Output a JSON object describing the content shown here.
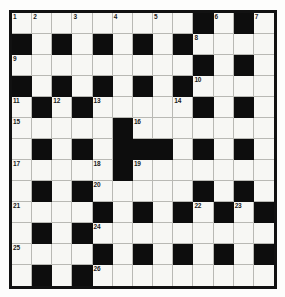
{
  "puzzle": {
    "title": "Crossword Grid",
    "type": "crossword",
    "size": {
      "rows": 13,
      "cols": 13
    },
    "colors": {
      "block": "#0d0d0d",
      "open": "#f7f7f4",
      "frame": "#111111",
      "gridline": "#b9b9b4",
      "number_text": "#1a1a1a",
      "page_background": "#fdfdfc"
    },
    "legend": {
      "white_symbol": ".",
      "black_symbol": "#"
    },
    "clue_number_count": 26,
    "clue_numbers": [
      1,
      2,
      3,
      4,
      5,
      6,
      7,
      8,
      9,
      10,
      11,
      12,
      13,
      14,
      15,
      16,
      17,
      18,
      19,
      20,
      21,
      22,
      23,
      24,
      25,
      26
    ],
    "rows": [
      {
        "index": 1,
        "pattern": ".........#.#.",
        "cells": [
          {
            "state": "white",
            "number": "1"
          },
          {
            "state": "white",
            "number": "2"
          },
          {
            "state": "white",
            "number": ""
          },
          {
            "state": "white",
            "number": "3"
          },
          {
            "state": "white",
            "number": ""
          },
          {
            "state": "white",
            "number": "4"
          },
          {
            "state": "white",
            "number": ""
          },
          {
            "state": "white",
            "number": "5"
          },
          {
            "state": "white",
            "number": ""
          },
          {
            "state": "black",
            "number": ""
          },
          {
            "state": "white",
            "number": "6"
          },
          {
            "state": "black",
            "number": ""
          },
          {
            "state": "white",
            "number": "7"
          }
        ]
      },
      {
        "index": 2,
        "pattern": "#.#.#.#.#....",
        "cells": [
          {
            "state": "black",
            "number": ""
          },
          {
            "state": "white",
            "number": ""
          },
          {
            "state": "black",
            "number": ""
          },
          {
            "state": "white",
            "number": ""
          },
          {
            "state": "black",
            "number": ""
          },
          {
            "state": "white",
            "number": ""
          },
          {
            "state": "black",
            "number": ""
          },
          {
            "state": "white",
            "number": ""
          },
          {
            "state": "black",
            "number": ""
          },
          {
            "state": "white",
            "number": "8"
          },
          {
            "state": "white",
            "number": ""
          },
          {
            "state": "white",
            "number": ""
          },
          {
            "state": "white",
            "number": ""
          }
        ]
      },
      {
        "index": 3,
        "pattern": ".........#.#.",
        "cells": [
          {
            "state": "white",
            "number": "9"
          },
          {
            "state": "white",
            "number": ""
          },
          {
            "state": "white",
            "number": ""
          },
          {
            "state": "white",
            "number": ""
          },
          {
            "state": "white",
            "number": ""
          },
          {
            "state": "white",
            "number": ""
          },
          {
            "state": "white",
            "number": ""
          },
          {
            "state": "white",
            "number": ""
          },
          {
            "state": "white",
            "number": ""
          },
          {
            "state": "black",
            "number": ""
          },
          {
            "state": "white",
            "number": ""
          },
          {
            "state": "black",
            "number": ""
          },
          {
            "state": "white",
            "number": ""
          }
        ]
      },
      {
        "index": 4,
        "pattern": "#.#.#.#.#....",
        "cells": [
          {
            "state": "black",
            "number": ""
          },
          {
            "state": "white",
            "number": ""
          },
          {
            "state": "black",
            "number": ""
          },
          {
            "state": "white",
            "number": ""
          },
          {
            "state": "black",
            "number": ""
          },
          {
            "state": "white",
            "number": ""
          },
          {
            "state": "black",
            "number": ""
          },
          {
            "state": "white",
            "number": ""
          },
          {
            "state": "black",
            "number": ""
          },
          {
            "state": "white",
            "number": "10"
          },
          {
            "state": "white",
            "number": ""
          },
          {
            "state": "white",
            "number": ""
          },
          {
            "state": "white",
            "number": ""
          }
        ]
      },
      {
        "index": 5,
        "pattern": ".#.#....#.#.#",
        "cells": [
          {
            "state": "white",
            "number": "11"
          },
          {
            "state": "black",
            "number": ""
          },
          {
            "state": "white",
            "number": "12"
          },
          {
            "state": "black",
            "number": ""
          },
          {
            "state": "white",
            "number": "13"
          },
          {
            "state": "white",
            "number": ""
          },
          {
            "state": "white",
            "number": ""
          },
          {
            "state": "white",
            "number": ""
          },
          {
            "state": "white",
            "number": "14"
          },
          {
            "state": "black",
            "number": ""
          },
          {
            "state": "white",
            "number": ""
          },
          {
            "state": "black",
            "number": ""
          },
          {
            "state": "white",
            "number": ""
          }
        ]
      },
      {
        "index": 6,
        "pattern": ".....#.......",
        "cells": [
          {
            "state": "white",
            "number": "15"
          },
          {
            "state": "white",
            "number": ""
          },
          {
            "state": "white",
            "number": ""
          },
          {
            "state": "white",
            "number": ""
          },
          {
            "state": "white",
            "number": ""
          },
          {
            "state": "black",
            "number": ""
          },
          {
            "state": "white",
            "number": "16"
          },
          {
            "state": "white",
            "number": ""
          },
          {
            "state": "white",
            "number": ""
          },
          {
            "state": "white",
            "number": ""
          },
          {
            "state": "white",
            "number": ""
          },
          {
            "state": "white",
            "number": ""
          },
          {
            "state": "white",
            "number": ""
          }
        ]
      },
      {
        "index": 7,
        "pattern": ".#.#.###.#.#.",
        "cells": [
          {
            "state": "white",
            "number": ""
          },
          {
            "state": "black",
            "number": ""
          },
          {
            "state": "white",
            "number": ""
          },
          {
            "state": "black",
            "number": ""
          },
          {
            "state": "white",
            "number": ""
          },
          {
            "state": "black",
            "number": ""
          },
          {
            "state": "black",
            "number": ""
          },
          {
            "state": "black",
            "number": ""
          },
          {
            "state": "white",
            "number": ""
          },
          {
            "state": "black",
            "number": ""
          },
          {
            "state": "white",
            "number": ""
          },
          {
            "state": "black",
            "number": ""
          },
          {
            "state": "white",
            "number": ""
          }
        ]
      },
      {
        "index": 8,
        "pattern": ".....#.......",
        "cells": [
          {
            "state": "white",
            "number": "17"
          },
          {
            "state": "white",
            "number": ""
          },
          {
            "state": "white",
            "number": ""
          },
          {
            "state": "white",
            "number": ""
          },
          {
            "state": "white",
            "number": "18"
          },
          {
            "state": "black",
            "number": ""
          },
          {
            "state": "white",
            "number": "19"
          },
          {
            "state": "white",
            "number": ""
          },
          {
            "state": "white",
            "number": ""
          },
          {
            "state": "white",
            "number": ""
          },
          {
            "state": "white",
            "number": ""
          },
          {
            "state": "white",
            "number": ""
          },
          {
            "state": "white",
            "number": ""
          }
        ]
      },
      {
        "index": 9,
        "pattern": ".#.#.....#.#.",
        "cells": [
          {
            "state": "white",
            "number": ""
          },
          {
            "state": "black",
            "number": ""
          },
          {
            "state": "white",
            "number": ""
          },
          {
            "state": "black",
            "number": ""
          },
          {
            "state": "white",
            "number": "20"
          },
          {
            "state": "white",
            "number": ""
          },
          {
            "state": "white",
            "number": ""
          },
          {
            "state": "white",
            "number": ""
          },
          {
            "state": "white",
            "number": ""
          },
          {
            "state": "black",
            "number": ""
          },
          {
            "state": "white",
            "number": ""
          },
          {
            "state": "black",
            "number": ""
          },
          {
            "state": "white",
            "number": ""
          }
        ]
      },
      {
        "index": 10,
        "pattern": "....#.#.#.#.#",
        "cells": [
          {
            "state": "white",
            "number": "21"
          },
          {
            "state": "white",
            "number": ""
          },
          {
            "state": "white",
            "number": ""
          },
          {
            "state": "white",
            "number": ""
          },
          {
            "state": "black",
            "number": ""
          },
          {
            "state": "white",
            "number": ""
          },
          {
            "state": "black",
            "number": ""
          },
          {
            "state": "white",
            "number": ""
          },
          {
            "state": "black",
            "number": ""
          },
          {
            "state": "white",
            "number": "22"
          },
          {
            "state": "black",
            "number": ""
          },
          {
            "state": "white",
            "number": "23"
          },
          {
            "state": "black",
            "number": ""
          }
        ]
      },
      {
        "index": 11,
        "pattern": ".#.#.........",
        "cells": [
          {
            "state": "white",
            "number": ""
          },
          {
            "state": "black",
            "number": ""
          },
          {
            "state": "white",
            "number": ""
          },
          {
            "state": "black",
            "number": ""
          },
          {
            "state": "white",
            "number": "24"
          },
          {
            "state": "white",
            "number": ""
          },
          {
            "state": "white",
            "number": ""
          },
          {
            "state": "white",
            "number": ""
          },
          {
            "state": "white",
            "number": ""
          },
          {
            "state": "white",
            "number": ""
          },
          {
            "state": "white",
            "number": ""
          },
          {
            "state": "white",
            "number": ""
          },
          {
            "state": "white",
            "number": ""
          }
        ]
      },
      {
        "index": 12,
        "pattern": "....#.#.#.#.#",
        "cells": [
          {
            "state": "white",
            "number": "25"
          },
          {
            "state": "white",
            "number": ""
          },
          {
            "state": "white",
            "number": ""
          },
          {
            "state": "white",
            "number": ""
          },
          {
            "state": "black",
            "number": ""
          },
          {
            "state": "white",
            "number": ""
          },
          {
            "state": "black",
            "number": ""
          },
          {
            "state": "white",
            "number": ""
          },
          {
            "state": "black",
            "number": ""
          },
          {
            "state": "white",
            "number": ""
          },
          {
            "state": "black",
            "number": ""
          },
          {
            "state": "white",
            "number": ""
          },
          {
            "state": "black",
            "number": ""
          }
        ]
      },
      {
        "index": 13,
        "pattern": ".#.#.........",
        "cells": [
          {
            "state": "white",
            "number": ""
          },
          {
            "state": "black",
            "number": ""
          },
          {
            "state": "white",
            "number": ""
          },
          {
            "state": "black",
            "number": ""
          },
          {
            "state": "white",
            "number": "26"
          },
          {
            "state": "white",
            "number": ""
          },
          {
            "state": "white",
            "number": ""
          },
          {
            "state": "white",
            "number": ""
          },
          {
            "state": "white",
            "number": ""
          },
          {
            "state": "white",
            "number": ""
          },
          {
            "state": "white",
            "number": ""
          },
          {
            "state": "white",
            "number": ""
          },
          {
            "state": "white",
            "number": ""
          }
        ]
      }
    ]
  }
}
